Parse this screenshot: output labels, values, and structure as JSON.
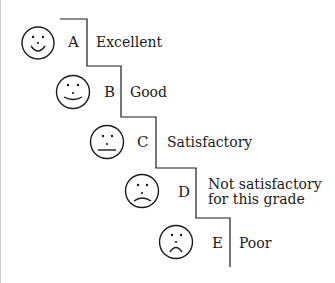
{
  "diagram": {
    "type": "grading-staircase",
    "line_color": "#1a1a1a",
    "levels": [
      {
        "grade": "A",
        "description": "Excellent",
        "face": "big-smile"
      },
      {
        "grade": "B",
        "description": "Good",
        "face": "smile"
      },
      {
        "grade": "C",
        "description": "Satisfactory",
        "face": "neutral"
      },
      {
        "grade": "D",
        "description_lines": [
          "Not satisfactory",
          "for this grade"
        ],
        "face": "slight-frown"
      },
      {
        "grade": "E",
        "description": "Poor",
        "face": "frown"
      }
    ]
  }
}
